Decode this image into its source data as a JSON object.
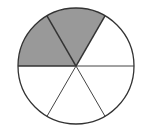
{
  "diagram": {
    "type": "fraction-circle",
    "total_slices": 6,
    "shaded_slices": 2,
    "center": [
      76,
      66
    ],
    "radius": 58,
    "start_angle_deg": 0,
    "shaded_indices": [
      1,
      2
    ],
    "colors": {
      "shaded": "#999999",
      "unshaded": "#ffffff",
      "stroke": "#333333",
      "divider_stroke": "#444444"
    }
  }
}
